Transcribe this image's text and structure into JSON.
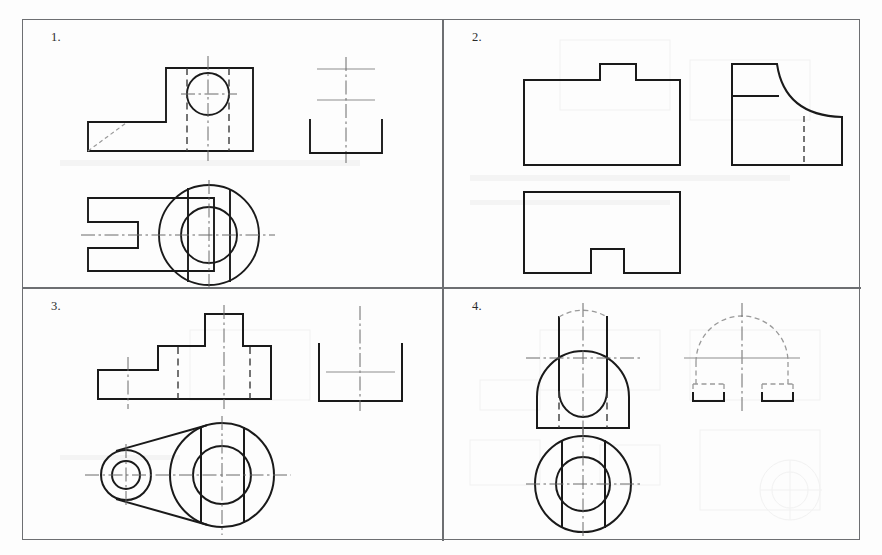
{
  "sheet": {
    "title": "Engineering Drawing Worksheet - Orthographic Projection Exercises",
    "background_color": "#fdfdfd",
    "border_color": "#6d6f72",
    "line_color": "#1a1a1a",
    "center_line_color": "#6b6b6b",
    "hidden_line_color": "#3a3a3a",
    "faint_line_color": "#8a8a8a",
    "width": 882,
    "height": 555
  },
  "exercises": [
    {
      "number": "1.",
      "name": "exercise-1",
      "description": "Bracket with cylindrical boss and slot",
      "views": [
        {
          "name": "front-view",
          "label": "front view",
          "features": [
            "stepped L-shaped outline",
            "circular hole",
            "hidden lines",
            "vertical centerline",
            "horizontal centerline",
            "diagonal chamfer line"
          ]
        },
        {
          "name": "side-view-incomplete",
          "label": "incomplete side view",
          "features": [
            "U-shaped partial outline",
            "construction crosshair lines"
          ]
        },
        {
          "name": "top-view",
          "label": "top view",
          "features": [
            "slotted rectangular body",
            "large circular boss",
            "inner circular hole",
            "center lines"
          ]
        }
      ]
    },
    {
      "number": "2.",
      "name": "exercise-2",
      "description": "Block with stepped profile and filleted corner",
      "views": [
        {
          "name": "front-view",
          "label": "front view",
          "features": [
            "rectangular body with raised central tab"
          ]
        },
        {
          "name": "side-view",
          "label": "side view",
          "features": [
            "concave fillet curve",
            "horizontal division line",
            "hidden vertical line"
          ]
        },
        {
          "name": "top-view",
          "label": "top view",
          "features": [
            "rectangle with bottom notch"
          ]
        }
      ]
    },
    {
      "number": "3.",
      "name": "exercise-3",
      "description": "Link plate with stepped base and two bores",
      "views": [
        {
          "name": "front-view",
          "label": "front view",
          "features": [
            "stepped pyramid profile",
            "hidden bore lines",
            "centerlines"
          ]
        },
        {
          "name": "side-view-incomplete",
          "label": "incomplete side view",
          "features": [
            "U-shaped partial outline",
            "construction crosshair lines"
          ]
        },
        {
          "name": "top-view",
          "label": "top view",
          "features": [
            "tapered link plate",
            "small circular bore",
            "large circular bore",
            "tangent lines",
            "centerlines"
          ]
        }
      ]
    },
    {
      "number": "4.",
      "name": "exercise-4",
      "description": "Rounded-top block with U-slot and through bore",
      "views": [
        {
          "name": "front-view",
          "label": "front view",
          "features": [
            "rounded top corners",
            "U-shaped slot",
            "hidden lines",
            "centerlines"
          ]
        },
        {
          "name": "side-view-incomplete",
          "label": "incomplete side view",
          "features": [
            "faint semicircular arc",
            "two small rectangular feet",
            "centerlines"
          ]
        },
        {
          "name": "top-view",
          "label": "top view",
          "features": [
            "outer circle",
            "inner circle",
            "two vertical chord lines",
            "centerlines"
          ]
        }
      ]
    }
  ]
}
